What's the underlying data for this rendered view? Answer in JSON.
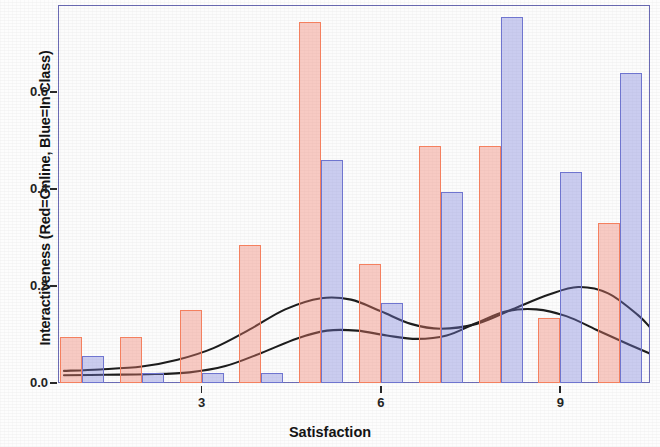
{
  "chart_data": {
    "type": "bar",
    "title": "",
    "subtitle": "",
    "xlabel": "Satisfaction",
    "ylabel": "Interactiveness (Red=Online, Blue=In Class)",
    "xlim": [
      0.6,
      10.5
    ],
    "ylim": [
      0.0,
      0.78
    ],
    "grid": false,
    "legend_position": "none",
    "legend_entries": [
      "Red=Online",
      "Blue=In Class"
    ],
    "xticks": [
      3,
      6,
      9
    ],
    "xtick_labels": [
      "3",
      "6",
      "9"
    ],
    "yticks": [
      0.0,
      0.2,
      0.4,
      0.6
    ],
    "ytick_labels": [
      "0.0",
      "0.2",
      "0.4",
      "0.6"
    ],
    "colors": {
      "online_red": "#f4805f",
      "inclass_blue": "#6f75cf",
      "panel_border": "#6b6bb5",
      "curve": "#1d1d1d",
      "background": "#fdfdfd"
    },
    "categories": [
      1,
      2,
      3,
      4,
      5,
      6,
      7,
      8,
      9,
      10
    ],
    "series": [
      {
        "name": "Online",
        "color": "#f4805f",
        "values": [
          0.095,
          0.095,
          0.15,
          0.285,
          0.745,
          0.245,
          0.49,
          0.49,
          0.135,
          0.33
        ]
      },
      {
        "name": "In Class",
        "color": "#6f75cf",
        "values": [
          0.055,
          0.02,
          0.02,
          0.02,
          0.46,
          0.165,
          0.395,
          0.755,
          0.435,
          0.64
        ]
      }
    ],
    "density_curves": [
      {
        "name": "Online density",
        "color": "#1d1d1d",
        "points": [
          [
            0.7,
            0.025
          ],
          [
            1.3,
            0.028
          ],
          [
            2.0,
            0.034
          ],
          [
            2.6,
            0.048
          ],
          [
            3.2,
            0.072
          ],
          [
            3.8,
            0.11
          ],
          [
            4.4,
            0.152
          ],
          [
            5.0,
            0.175
          ],
          [
            5.5,
            0.172
          ],
          [
            6.0,
            0.148
          ],
          [
            6.5,
            0.122
          ],
          [
            7.0,
            0.112
          ],
          [
            7.6,
            0.122
          ],
          [
            8.2,
            0.152
          ],
          [
            8.8,
            0.182
          ],
          [
            9.3,
            0.198
          ],
          [
            9.8,
            0.185
          ],
          [
            10.3,
            0.14
          ],
          [
            10.55,
            0.108
          ]
        ]
      },
      {
        "name": "In Class density",
        "color": "#1d1d1d",
        "points": [
          [
            0.7,
            0.016
          ],
          [
            1.4,
            0.017
          ],
          [
            2.1,
            0.018
          ],
          [
            2.8,
            0.022
          ],
          [
            3.4,
            0.035
          ],
          [
            4.0,
            0.062
          ],
          [
            4.6,
            0.092
          ],
          [
            5.1,
            0.108
          ],
          [
            5.6,
            0.108
          ],
          [
            6.1,
            0.098
          ],
          [
            6.6,
            0.091
          ],
          [
            7.1,
            0.098
          ],
          [
            7.6,
            0.124
          ],
          [
            8.1,
            0.148
          ],
          [
            8.6,
            0.152
          ],
          [
            9.1,
            0.138
          ],
          [
            9.6,
            0.11
          ],
          [
            10.1,
            0.082
          ],
          [
            10.55,
            0.058
          ]
        ]
      }
    ]
  },
  "axes": {
    "x_title": "Satisfaction",
    "y_title": "Interactiveness (Red=Online, Blue=In Class)"
  }
}
